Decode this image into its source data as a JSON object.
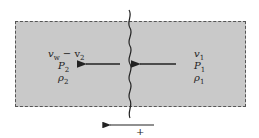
{
  "diagram": {
    "region_fill": "#c9c9c9",
    "left_state": {
      "velocity": "v",
      "velocity_sub": "w",
      "velocity_minus": " − v",
      "velocity_minus_sub": "2",
      "pressure": "P",
      "pressure_sub": "2",
      "density": "ρ",
      "density_sub": "2"
    },
    "right_state": {
      "velocity": "v",
      "velocity_sub": "1",
      "pressure": "P",
      "pressure_sub": "1",
      "density": "ρ",
      "density_sub": "1"
    },
    "direction_label": "+",
    "arrows": [
      "flow-left-arrow",
      "flow-right-arrow",
      "positive-direction-arrow"
    ]
  }
}
